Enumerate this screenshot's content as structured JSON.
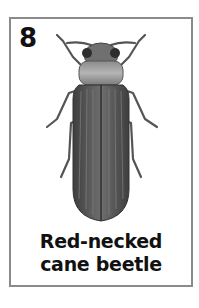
{
  "card": {
    "number": "8",
    "caption_line1": "Red-necked",
    "caption_line2": "cane beetle",
    "illustration": "beetle-icon",
    "colors": {
      "border": "#8a8a8a",
      "text": "#111111",
      "beetle_body": "#5a5a5a",
      "beetle_pronotum": "#9a9a9a"
    }
  }
}
